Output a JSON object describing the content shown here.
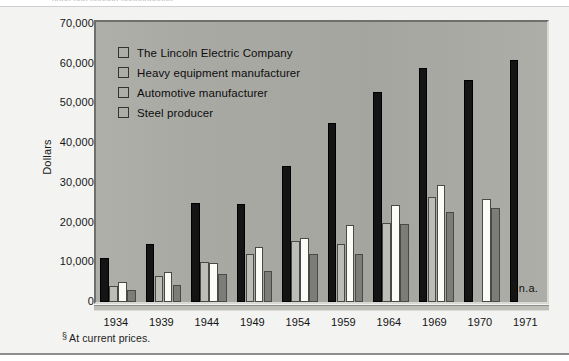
{
  "top_clipped_text": "xxxx xxx xxxxxx xxxxxxxxxxx",
  "figure": {
    "y_axis_title": "Dollars",
    "footnote_mark": "§",
    "footnote_text": "At current prices.",
    "na_note": "n.a."
  },
  "legend": {
    "items": [
      {
        "label": "The Lincoln Electric Company",
        "swatch": "legend-swatch-black",
        "color": "#141414"
      },
      {
        "label": "Heavy equipment manufacturer",
        "swatch": "legend-swatch-light-gray",
        "color": "#bdbdb8"
      },
      {
        "label": "Automotive manufacturer",
        "swatch": "legend-swatch-white",
        "color": "#fbfbf8"
      },
      {
        "label": "Steel producer",
        "swatch": "legend-swatch-dark-gray",
        "color": "#7c7c78"
      }
    ]
  },
  "chart_data": {
    "type": "bar",
    "title": "",
    "subtitle": "",
    "xlabel": "",
    "ylabel": "Dollars",
    "ylim": [
      0,
      70000
    ],
    "ytick_labels": [
      "70,000",
      "60,000",
      "50,000",
      "40,000",
      "30,000",
      "20,000",
      "10,000",
      "0"
    ],
    "ytick_values": [
      70000,
      60000,
      50000,
      40000,
      30000,
      20000,
      10000,
      0
    ],
    "grid": false,
    "legend_position": "inside-top-left",
    "categories": [
      "1934",
      "1939",
      "1944",
      "1949",
      "1954",
      "1959",
      "1964",
      "1969",
      "1970",
      "1971"
    ],
    "series": [
      {
        "name": "The Lincoln Electric Company",
        "color": "#141414",
        "values": [
          11000,
          14700,
          25000,
          24800,
          34300,
          45200,
          52800,
          59000,
          55800,
          61000
        ]
      },
      {
        "name": "Heavy equipment manufacturer",
        "color": "#bdbdb8",
        "values": [
          4000,
          6500,
          10000,
          12200,
          15300,
          14600,
          20000,
          26500,
          null,
          null
        ]
      },
      {
        "name": "Automotive manufacturer",
        "color": "#fbfbf8",
        "values": [
          5000,
          7500,
          9700,
          13800,
          16000,
          19500,
          24500,
          29500,
          26000,
          null
        ]
      },
      {
        "name": "Steel producer",
        "color": "#7c7c78",
        "values": [
          3000,
          4200,
          7000,
          7900,
          12200,
          12000,
          19600,
          22700,
          23600,
          null
        ]
      }
    ],
    "annotations": [
      {
        "text": "n.a.",
        "position": "bottom-right",
        "meaning": "not available"
      }
    ]
  }
}
